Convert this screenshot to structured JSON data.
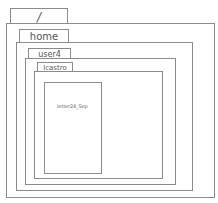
{
  "diagram": {
    "type": "nested-folder-tree",
    "colors": {
      "border": "#8a8a8a",
      "text": "#555555",
      "background": "#ffffff"
    },
    "folders": [
      {
        "label": "/"
      },
      {
        "label": "home"
      },
      {
        "label": "user4"
      },
      {
        "label": "lcastro"
      }
    ],
    "file": {
      "label": "letter24_Sep"
    }
  }
}
